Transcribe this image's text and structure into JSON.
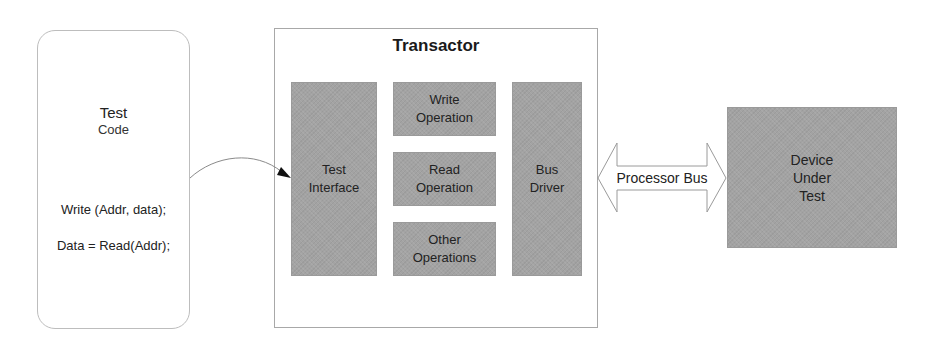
{
  "test_code": {
    "title": "Test",
    "subtitle": "Code",
    "lines": [
      "Write (Addr, data);",
      "Data = Read(Addr);"
    ]
  },
  "transactor": {
    "title": "Transactor",
    "blocks": {
      "test_interface": [
        "Test",
        "Interface"
      ],
      "write_operation": [
        "Write",
        "Operation"
      ],
      "read_operation": [
        "Read",
        "Operation"
      ],
      "other_operations": [
        "Other",
        "Operations"
      ],
      "bus_driver": [
        "Bus",
        "Driver"
      ]
    }
  },
  "bus": {
    "label": "Processor Bus"
  },
  "device": {
    "lines": [
      "Device",
      "Under",
      "Test"
    ]
  },
  "colors": {
    "block_fill": "#a3a3a3",
    "border": "#a8a8a8",
    "background": "#ffffff"
  }
}
